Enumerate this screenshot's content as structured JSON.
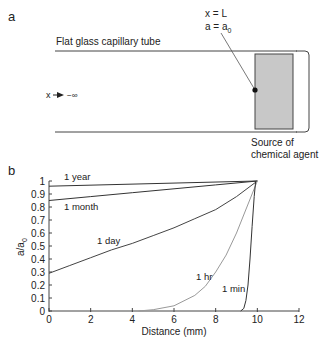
{
  "panel_a": {
    "label": "a",
    "tube_label": "Flat glass capillary tube",
    "boundary_x": "x = L",
    "boundary_a": "a = a",
    "boundary_a_sub": "0",
    "far_field_x": "x",
    "far_field_limit": "−∞",
    "source_line1": "Source of",
    "source_line2": "chemical agent",
    "source_fill": "#c8c8c8"
  },
  "panel_b": {
    "label": "b",
    "ylabel_main": "a/a",
    "ylabel_sub": "0",
    "xlabel": "Distance (mm)",
    "yticks": [
      "0",
      "0.1",
      "0.2",
      "0.3",
      "0.4",
      "0.5",
      "0.6",
      "0.7",
      "0.8",
      "0.9",
      "1"
    ],
    "xticks": [
      "0",
      "2",
      "4",
      "6",
      "8",
      "10",
      "12"
    ],
    "curve_labels": {
      "year": "1 year",
      "month": "1 month",
      "day": "1 day",
      "hr": "1 hr",
      "min": "1 min"
    }
  },
  "chart_data": {
    "type": "line",
    "title": "",
    "xlabel": "Distance (mm)",
    "ylabel": "a/a0",
    "xlim": [
      0,
      12
    ],
    "ylim": [
      0,
      1
    ],
    "grid": false,
    "legend": "inline labels",
    "series": [
      {
        "name": "1 year",
        "color": "#333333",
        "x": [
          0,
          10
        ],
        "y": [
          0.96,
          1.0
        ]
      },
      {
        "name": "1 month",
        "color": "#333333",
        "x": [
          0,
          2,
          4,
          6,
          8,
          10
        ],
        "y": [
          0.85,
          0.88,
          0.91,
          0.94,
          0.97,
          1.0
        ]
      },
      {
        "name": "1 day",
        "color": "#444444",
        "x": [
          0,
          1,
          2,
          3,
          4,
          5,
          6,
          7,
          8,
          9,
          10
        ],
        "y": [
          0.29,
          0.35,
          0.41,
          0.47,
          0.52,
          0.58,
          0.64,
          0.71,
          0.78,
          0.88,
          1.0
        ]
      },
      {
        "name": "1 hr",
        "color": "#999999",
        "x": [
          4.3,
          5,
          6,
          7,
          7.5,
          8,
          8.5,
          9,
          9.5,
          10
        ],
        "y": [
          0,
          0.01,
          0.04,
          0.12,
          0.19,
          0.3,
          0.43,
          0.6,
          0.8,
          1.0
        ]
      },
      {
        "name": "1 min",
        "color": "#333333",
        "x": [
          9.2,
          9.35,
          9.45,
          9.55,
          9.65,
          9.75,
          9.85,
          9.92
        ],
        "y": [
          0,
          0.02,
          0.08,
          0.2,
          0.4,
          0.65,
          0.88,
          1.0
        ]
      }
    ]
  }
}
